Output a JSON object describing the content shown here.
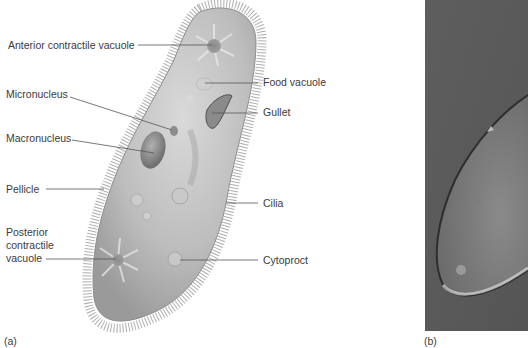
{
  "figure": {
    "panel_a": {
      "letter": "(a)",
      "subject": "Paramecium illustration",
      "labels": {
        "anterior_contractile_vacuole": "Anterior contractile vacuole",
        "food_vacuole": "Food vacuole",
        "micronucleus": "Micronucleus",
        "gullet": "Gullet",
        "macronucleus": "Macronucleus",
        "pellicle": "Pellicle",
        "cilia": "Cilia",
        "posterior_contractile_vacuole_l1": "Posterior",
        "posterior_contractile_vacuole_l2": "contractile",
        "posterior_contractile_vacuole_l3": "vacuole",
        "cytoproct": "Cytoproct"
      }
    },
    "panel_b": {
      "letter": "(b)",
      "subject": "Micrograph of Paramecium"
    },
    "colors": {
      "background": "#ffffff",
      "leader_line": "#555555",
      "cell_body": "#b8b8b8",
      "micrograph_bg": "#5a5a5a"
    }
  }
}
